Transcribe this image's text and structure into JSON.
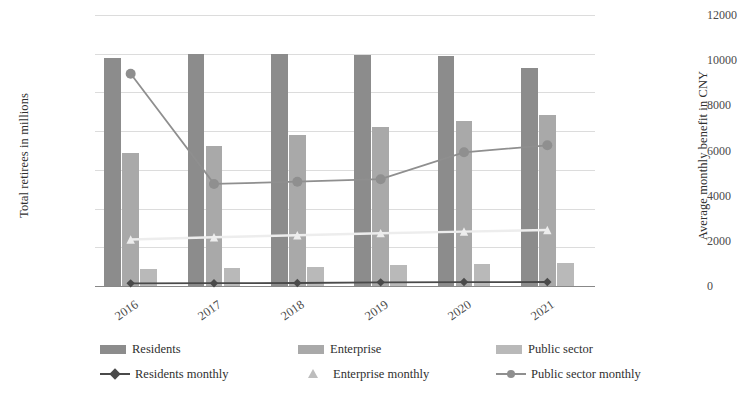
{
  "chart_data": {
    "type": "bar",
    "title": "",
    "subtitle": "",
    "categories": [
      "2016",
      "2017",
      "2018",
      "2019",
      "2020",
      "2021"
    ],
    "xlabel": "",
    "ylabel": "Total retirees in millions",
    "y2label": "Average monthly benefit in CNY",
    "ylim": [
      0,
      14
    ],
    "y2lim": [
      0,
      12000
    ],
    "ytick_labels": [
      "0.00",
      "2.00",
      "4.00",
      "6.00",
      "8.00",
      "10.00",
      "12.00",
      "14.00"
    ],
    "ytick_values": [
      0,
      2,
      4,
      6,
      8,
      10,
      12,
      14
    ],
    "y2tick_labels": [
      "0",
      "2000",
      "4000",
      "6000",
      "8000",
      "10000",
      "12000"
    ],
    "y2tick_values": [
      0,
      2000,
      4000,
      6000,
      8000,
      10000,
      12000
    ],
    "grid": true,
    "legend_position": "bottom",
    "bar_series": [
      {
        "name": "Residents",
        "axis": "left",
        "color": "#8c8c8c",
        "values": [
          11.8,
          12.0,
          12.0,
          11.95,
          11.9,
          11.25
        ]
      },
      {
        "name": "Enterprise",
        "axis": "left",
        "color": "#a9a9a9",
        "values": [
          6.85,
          7.25,
          7.8,
          8.2,
          8.5,
          8.85
        ]
      },
      {
        "name": "Public sector",
        "axis": "left",
        "color": "#b9b9b9",
        "values": [
          0.9,
          0.95,
          1.0,
          1.08,
          1.12,
          1.2
        ]
      }
    ],
    "line_series": [
      {
        "name": "Residents monthly",
        "axis": "right",
        "color": "#4a4a4a",
        "marker": "diamond",
        "values": [
          117,
          125,
          132,
          162,
          174,
          179
        ]
      },
      {
        "name": "Enterprise monthly",
        "axis": "right",
        "color": "#ededed",
        "marker": "triangle",
        "values": [
          2060,
          2160,
          2250,
          2340,
          2410,
          2480
        ]
      },
      {
        "name": "Public sector monthly",
        "axis": "right",
        "color": "#8f8f8f",
        "marker": "circle",
        "values": [
          9400,
          4520,
          4620,
          4730,
          5920,
          6230
        ]
      }
    ]
  },
  "legend": {
    "items": [
      {
        "label": "Residents",
        "kind": "swatch",
        "color": "#8c8c8c"
      },
      {
        "label": "Enterprise",
        "kind": "swatch",
        "color": "#a9a9a9"
      },
      {
        "label": "Public sector",
        "kind": "swatch",
        "color": "#b9b9b9"
      },
      {
        "label": "Residents monthly",
        "kind": "diamond",
        "color": "#4a4a4a"
      },
      {
        "label": "Enterprise monthly",
        "kind": "triangle",
        "color": "#bdbdbd"
      },
      {
        "label": "Public sector monthly",
        "kind": "circle",
        "color": "#8f8f8f"
      }
    ]
  }
}
